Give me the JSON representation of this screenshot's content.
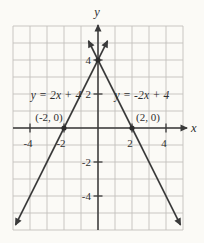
{
  "figure": {
    "background": "#fbfaf6",
    "grid_color": "#c3c1bc",
    "axis_color": "#3a3a3a",
    "line_color": "#3a3a3a",
    "point_color": "#2c2c2c",
    "text_color": "#2f2f2f"
  },
  "chart_data": {
    "type": "line",
    "title": "",
    "xlabel": "x",
    "ylabel": "y",
    "xlim": [
      -5,
      5
    ],
    "ylim": [
      -6,
      6
    ],
    "grid": true,
    "x_tick_labels": [
      -4,
      -2,
      2,
      4
    ],
    "y_tick_labels": [
      4,
      2,
      -2,
      -4
    ],
    "series": [
      {
        "name": "y = 2x + 4",
        "equation": "y = 2x + 4",
        "slope": 2,
        "intercept": 4,
        "draw_range": [
          -4.85,
          0.56
        ],
        "label_pos": {
          "x": -2.45,
          "y": 1.7
        }
      },
      {
        "name": "y = -2x + 4",
        "equation": "y = -2x + 4",
        "slope": -2,
        "intercept": 4,
        "draw_range": [
          -0.56,
          4.85
        ],
        "label_pos": {
          "x": 2.6,
          "y": 1.7
        }
      }
    ],
    "points": [
      {
        "x": -2,
        "y": 0,
        "label": "(-2, 0)"
      },
      {
        "x": 2,
        "y": 0,
        "label": "(2, 0)"
      },
      {
        "x": 0,
        "y": 4,
        "label": ""
      }
    ],
    "intersection": {
      "x": 0,
      "y": 4
    }
  }
}
